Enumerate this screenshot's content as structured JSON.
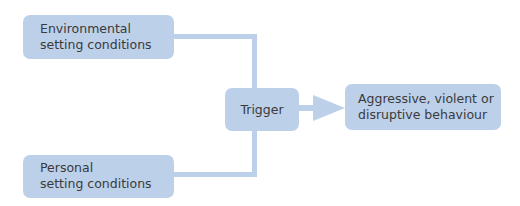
{
  "diagram": {
    "type": "flowchart",
    "colors": {
      "box_fill": "#bcd0ea",
      "connector": "#bcd0ea",
      "text": "#3a3a3a",
      "background": "#ffffff"
    },
    "nodes": [
      {
        "id": "environmental",
        "label": "Environmental\nsetting conditions"
      },
      {
        "id": "personal",
        "label": "Personal\nsetting conditions"
      },
      {
        "id": "trigger",
        "label": "Trigger"
      },
      {
        "id": "behaviour",
        "label": "Aggressive, violent or\ndisruptive behaviour"
      }
    ],
    "edges": [
      {
        "from": "environmental",
        "to": "trigger",
        "style": "elbow-line"
      },
      {
        "from": "personal",
        "to": "trigger",
        "style": "elbow-line"
      },
      {
        "from": "trigger",
        "to": "behaviour",
        "style": "arrow"
      }
    ]
  }
}
